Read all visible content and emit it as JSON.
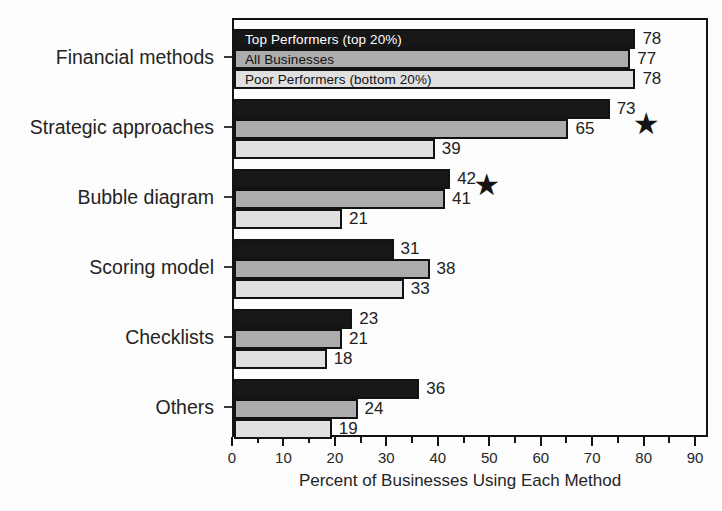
{
  "chart_data": {
    "type": "bar",
    "orientation": "horizontal",
    "title": "",
    "xlabel": "Percent of Businesses Using Each Method",
    "ylabel": "",
    "xlim": [
      0,
      92.5
    ],
    "x_major_ticks": [
      0,
      10,
      20,
      30,
      40,
      50,
      60,
      70,
      80,
      90
    ],
    "x_minor_step": 5,
    "grid": "off",
    "legend_position": "inside-first-group-bars",
    "categories": [
      "Financial methods",
      "Strategic approaches",
      "Bubble diagram",
      "Scoring model",
      "Checklists",
      "Others"
    ],
    "series": [
      {
        "name": "Top Performers (top 20%)",
        "color": "#171717",
        "values": [
          78,
          73,
          42,
          31,
          23,
          36
        ]
      },
      {
        "name": "All Businesses",
        "color": "#acacac",
        "values": [
          77,
          65,
          41,
          38,
          21,
          24
        ]
      },
      {
        "name": "Poor Performers (bottom 20%)",
        "color": "#e0e0e0",
        "values": [
          78,
          39,
          21,
          33,
          18,
          19
        ]
      }
    ],
    "annotations": [
      {
        "type": "star",
        "glyph": "★",
        "category": "Strategic approaches",
        "category_index": 1,
        "x_value": 80.5,
        "y_offset_px": 27
      },
      {
        "type": "star",
        "glyph": "★",
        "category": "Bubble diagram",
        "category_index": 2,
        "x_value": 49.5,
        "y_offset_px": 18
      }
    ],
    "colors": {
      "bar_border": "#121212",
      "axis": "#141414",
      "text": "#242424",
      "background": "#fdfdfd",
      "legend_text_on_dark": "#ffffff",
      "legend_text_on_light": "#111111"
    }
  }
}
